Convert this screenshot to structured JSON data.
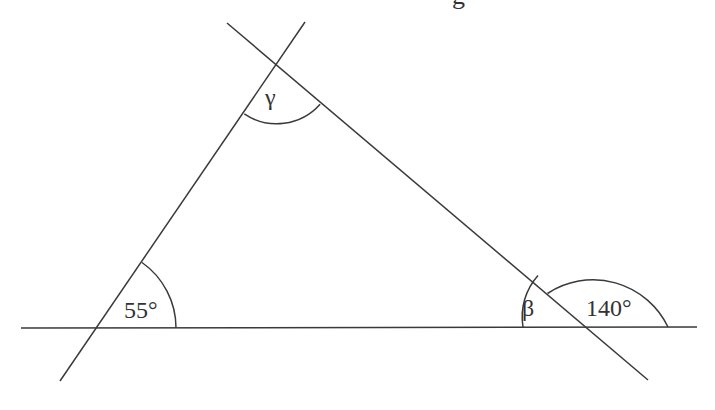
{
  "diagram": {
    "type": "triangle-angles",
    "clipped_top_text": "g",
    "stroke_color": "#3a3a3a",
    "vertices": {
      "top": {
        "x": 277,
        "y": 66
      },
      "bottom_left": {
        "x": 96,
        "y": 328
      },
      "bottom_right": {
        "x": 585,
        "y": 327
      }
    },
    "labels": {
      "gamma": "γ",
      "angle_bottom_left": "55°",
      "beta": "β",
      "exterior_angle": "140°"
    },
    "lines": {
      "baseline": {
        "x1": 21,
        "y1": 328,
        "x2": 697,
        "y2": 327
      },
      "left_side": {
        "x1": 305,
        "y1": 22,
        "x2": 60,
        "y2": 381
      },
      "right_side": {
        "x1": 227,
        "y1": 23,
        "x2": 648,
        "y2": 380
      }
    }
  }
}
